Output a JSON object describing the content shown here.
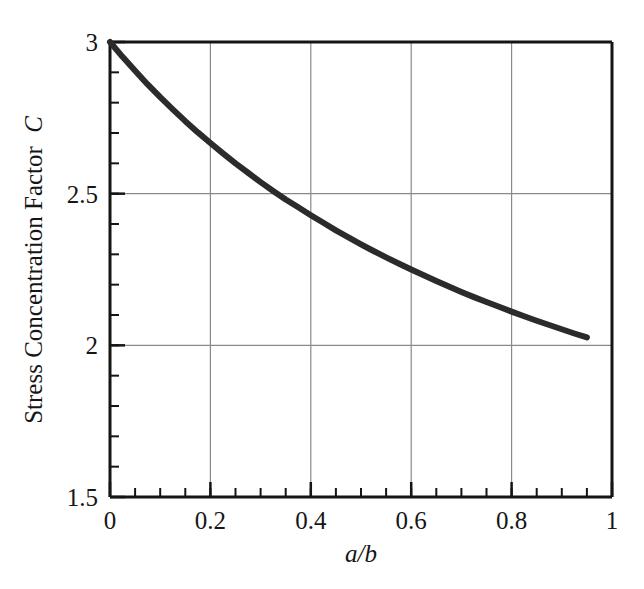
{
  "chart_data": {
    "type": "line",
    "title": "",
    "subtitle": "",
    "xlabel": "a/b",
    "xlabel_parts": {
      "numerator": "a",
      "slash": "/",
      "denominator": "b"
    },
    "ylabel": "Stress Concentration Factor C",
    "ylabel_text": "Stress Concentration Factor",
    "ylabel_symbol": "C",
    "xlim": [
      0,
      1
    ],
    "ylim": [
      1.5,
      3
    ],
    "grid": true,
    "grid_color": "#8a8a8a",
    "legend": null,
    "legend_position": "none",
    "axis_color": "#151515",
    "series_color": "#2b2b2b",
    "series_width": 6,
    "x_major_ticks": [
      0,
      0.2,
      0.4,
      0.6,
      0.8,
      1
    ],
    "x_major_tick_labels": [
      "0",
      "0.2",
      "0.4",
      "0.6",
      "0.8",
      "1"
    ],
    "x_minor_tick_step": 0.05,
    "y_major_ticks": [
      1.5,
      2,
      2.5,
      3
    ],
    "y_major_tick_labels": [
      "1.5",
      "2",
      "2.5",
      "3"
    ],
    "y_minor_tick_step": 0.1,
    "series": [
      {
        "name": "Stress Concentration Factor",
        "formula": "C = 1 + 2/(1 + a/b)",
        "x": [
          0.0,
          0.025,
          0.05,
          0.075,
          0.1,
          0.125,
          0.15,
          0.175,
          0.2,
          0.225,
          0.25,
          0.275,
          0.3,
          0.325,
          0.35,
          0.375,
          0.4,
          0.425,
          0.45,
          0.475,
          0.5,
          0.525,
          0.55,
          0.575,
          0.6,
          0.625,
          0.65,
          0.675,
          0.7,
          0.725,
          0.75,
          0.775,
          0.8,
          0.825,
          0.85,
          0.875,
          0.9,
          0.925,
          0.95
        ],
        "values": [
          3.0,
          2.951,
          2.905,
          2.86,
          2.818,
          2.778,
          2.739,
          2.702,
          2.667,
          2.633,
          2.6,
          2.569,
          2.538,
          2.509,
          2.481,
          2.455,
          2.429,
          2.404,
          2.379,
          2.356,
          2.333,
          2.311,
          2.29,
          2.27,
          2.25,
          2.231,
          2.212,
          2.194,
          2.176,
          2.159,
          2.143,
          2.127,
          2.111,
          2.096,
          2.081,
          2.067,
          2.053,
          2.039,
          2.026
        ]
      }
    ],
    "annotations": [],
    "notable_points": [
      {
        "x": 0.0,
        "y": 3.0,
        "note": "curve start at upper-left corner"
      },
      {
        "x": 0.2,
        "y": 2.667,
        "note": "near 2.5 gridline crossing"
      },
      {
        "x": 0.6,
        "y": 2.25,
        "note": "mid-range"
      },
      {
        "x": 0.95,
        "y": 2.026,
        "note": "curve end just above 2"
      }
    ]
  },
  "figure": {
    "background_color": "#ffffff",
    "plot_left_px": 110,
    "plot_right_px": 612,
    "plot_top_px": 42,
    "plot_bottom_px": 497
  }
}
